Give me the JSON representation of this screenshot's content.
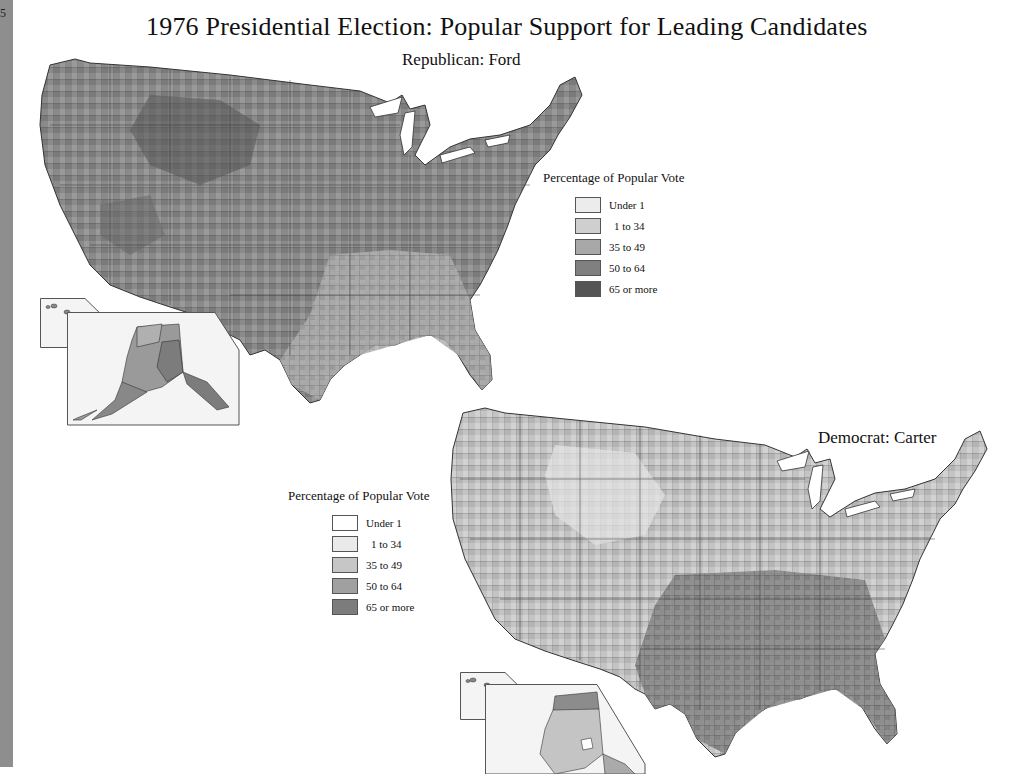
{
  "page": {
    "spine_mark": "5",
    "title": "1976 Presidential Election: Popular Support for Leading Candidates"
  },
  "maps": [
    {
      "id": "ford",
      "subtitle": "Republican: Ford",
      "legend": {
        "title": "Percentage of Popular Vote",
        "items": [
          {
            "label": "Under 1",
            "color": "#ececec"
          },
          {
            "label": "1 to 34",
            "color": "#cfcfcf"
          },
          {
            "label": "35 to 49",
            "color": "#a8a8a8"
          },
          {
            "label": "50 to 64",
            "color": "#808080"
          },
          {
            "label": "65 or more",
            "color": "#555555"
          }
        ]
      },
      "insets": [
        "Hawaii",
        "Alaska"
      ]
    },
    {
      "id": "carter",
      "subtitle": "Democrat: Carter",
      "legend": {
        "title": "Percentage of Popular Vote",
        "items": [
          {
            "label": "Under 1",
            "color": "#ffffff"
          },
          {
            "label": "1 to 34",
            "color": "#eaeaea"
          },
          {
            "label": "35 to 49",
            "color": "#c6c6c6"
          },
          {
            "label": "50 to 64",
            "color": "#a0a0a0"
          },
          {
            "label": "65 or more",
            "color": "#7c7c7c"
          }
        ]
      },
      "insets": [
        "Hawaii",
        "Alaska"
      ]
    }
  ]
}
